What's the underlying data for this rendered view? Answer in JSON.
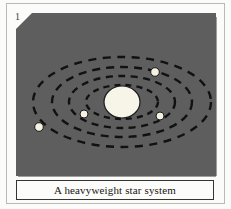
{
  "figure": {
    "number": "1",
    "caption": "A heavyweight star system",
    "panel_color": "#5e5e5e",
    "page_color": "#fbfbfa",
    "caption_border_color": "#35352f",
    "caption_background": "#fcfcfb"
  },
  "chart_data": {
    "type": "scatter",
    "title": "A heavyweight star system",
    "xlabel": "",
    "ylabel": "",
    "grid": false,
    "legend": "none",
    "background": "#5e5e5e",
    "star": {
      "name": "central-star",
      "cx": 106,
      "cy": 89,
      "rx": 18,
      "ry": 16,
      "color": "#f7f4e8",
      "stroke": "#1a1a1a"
    },
    "orbits": [
      {
        "name": "orbit-1",
        "rx": 36,
        "ry": 17,
        "color": "#111111",
        "dash": "6 5",
        "width": 2.4
      },
      {
        "name": "orbit-2",
        "rx": 53,
        "ry": 26,
        "color": "#111111",
        "dash": "7 5.5",
        "width": 2.4
      },
      {
        "name": "orbit-3",
        "rx": 70,
        "ry": 35,
        "color": "#111111",
        "dash": "8 6",
        "width": 2.4
      },
      {
        "name": "orbit-4",
        "rx": 89,
        "ry": 45,
        "color": "#111111",
        "dash": "8 6.5",
        "width": 2.4
      }
    ],
    "planets": [
      {
        "name": "planet-1",
        "orbit": 1,
        "cx": 68,
        "cy": 101,
        "r": 4.0,
        "color": "#f5f2e4"
      },
      {
        "name": "planet-2",
        "orbit": 2,
        "cx": 144,
        "cy": 103,
        "r": 4.0,
        "color": "#f5f2e4"
      },
      {
        "name": "planet-3",
        "orbit": 3,
        "cx": 139,
        "cy": 59,
        "r": 4.3,
        "color": "#f5f2e4"
      },
      {
        "name": "planet-4",
        "orbit": 4,
        "cx": 23,
        "cy": 114,
        "r": 4.3,
        "color": "#f5f2e4"
      }
    ]
  }
}
